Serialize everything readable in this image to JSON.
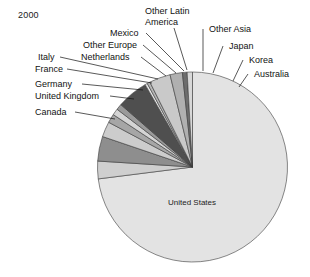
{
  "year_label": "2000",
  "chart_data": {
    "type": "pie",
    "title": "2000",
    "xlabel": "",
    "ylabel": "",
    "legend_position": "callout-labels",
    "grid": false,
    "center": {
      "x": 192.5,
      "y": 167
    },
    "radius": 95,
    "start_angle_deg": -90,
    "direction": "clockwise",
    "categories": [
      "United States",
      "Canada",
      "United Kingdom",
      "Germany",
      "France",
      "Italy",
      "Netherlands",
      "Other Europe",
      "Mexico",
      "Other Latin America",
      "Other Asia",
      "Japan",
      "Korea",
      "Australia"
    ],
    "values": [
      73.0,
      3.0,
      4.2,
      2.6,
      1.5,
      1.1,
      1.0,
      5.3,
      0.4,
      0.5,
      3.6,
      2.1,
      0.8,
      0.9
    ],
    "colors": [
      "#e3e3e3",
      "#cfcfcf",
      "#8e8e8e",
      "#cccccc",
      "#a6a6a6",
      "#d4d4d4",
      "#9a9a9a",
      "#4f4f4f",
      "#e8e8e8",
      "#b5b5b5",
      "#c9c9c9",
      "#b0b0b0",
      "#6d6d6d",
      "#d8d8d8"
    ],
    "inside_labels": [
      {
        "text": "United States",
        "x": 192,
        "y": 205
      }
    ]
  },
  "callouts": [
    {
      "name": "other-latin-america",
      "lines": [
        "Other Latin",
        "America"
      ],
      "x": 145,
      "y": 14,
      "anchor": "start",
      "line": [
        [
          174,
          28
        ],
        [
          187,
          70
        ]
      ]
    },
    {
      "name": "mexico",
      "lines": [
        "Mexico"
      ],
      "x": 110,
      "y": 36,
      "anchor": "start",
      "line": [
        [
          146,
          33
        ],
        [
          184,
          71
        ]
      ]
    },
    {
      "name": "other-europe",
      "lines": [
        "Other Europe"
      ],
      "x": 83,
      "y": 48,
      "anchor": "start",
      "line": [
        [
          143,
          45
        ],
        [
          176,
          73
        ]
      ]
    },
    {
      "name": "netherlands",
      "lines": [
        "Netherlands"
      ],
      "x": 81,
      "y": 60,
      "anchor": "start",
      "line": [
        [
          141,
          57
        ],
        [
          166,
          76
        ]
      ]
    },
    {
      "name": "italy",
      "lines": [
        "Italy"
      ],
      "x": 38,
      "y": 60,
      "anchor": "start",
      "line": [
        [
          60,
          57
        ],
        [
          158,
          79
        ]
      ]
    },
    {
      "name": "france",
      "lines": [
        "France"
      ],
      "x": 35,
      "y": 72,
      "anchor": "start",
      "line": [
        [
          67,
          69
        ],
        [
          152,
          83
        ]
      ]
    },
    {
      "name": "germany",
      "lines": [
        "Germany"
      ],
      "x": 35,
      "y": 87,
      "anchor": "start",
      "line": [
        [
          82,
          84
        ],
        [
          143,
          90
        ]
      ]
    },
    {
      "name": "united-kingdom",
      "lines": [
        "United Kingdom"
      ],
      "x": 35,
      "y": 99,
      "anchor": "start",
      "line": [
        [
          110,
          96
        ],
        [
          134,
          99
        ]
      ]
    },
    {
      "name": "canada",
      "lines": [
        "Canada"
      ],
      "x": 35,
      "y": 115,
      "anchor": "start",
      "line": [
        [
          75,
          112
        ],
        [
          115,
          119
        ]
      ]
    },
    {
      "name": "other-asia",
      "lines": [
        "Other Asia"
      ],
      "x": 209,
      "y": 32,
      "anchor": "start",
      "line": [
        [
          203,
          29
        ],
        [
          203,
          71
        ]
      ]
    },
    {
      "name": "japan",
      "lines": [
        "Japan"
      ],
      "x": 229,
      "y": 49,
      "anchor": "start",
      "line": [
        [
          223,
          46
        ],
        [
          213,
          73
        ]
      ]
    },
    {
      "name": "korea",
      "lines": [
        "Korea"
      ],
      "x": 249,
      "y": 63,
      "anchor": "start",
      "line": [
        [
          243,
          60
        ],
        [
          233,
          81
        ]
      ]
    },
    {
      "name": "australia",
      "lines": [
        "Australia"
      ],
      "x": 254,
      "y": 77,
      "anchor": "start",
      "line": [
        [
          248,
          74
        ],
        [
          239,
          87
        ]
      ]
    }
  ]
}
